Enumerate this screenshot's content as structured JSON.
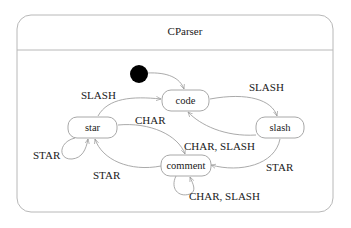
{
  "diagram": {
    "title": "CParser",
    "initial_state": "initial-pseudostate",
    "states": [
      {
        "id": "code",
        "label": "code"
      },
      {
        "id": "star",
        "label": "star"
      },
      {
        "id": "slash",
        "label": "slash"
      },
      {
        "id": "comment",
        "label": "comment"
      }
    ],
    "transitions": [
      {
        "from": "initial",
        "to": "code",
        "label": ""
      },
      {
        "from": "code",
        "to": "slash",
        "label": "SLASH"
      },
      {
        "from": "slash",
        "to": "code",
        "label": "CHAR, SLASH"
      },
      {
        "from": "slash",
        "to": "comment",
        "label": "STAR"
      },
      {
        "from": "comment",
        "to": "comment",
        "label": "CHAR, SLASH"
      },
      {
        "from": "comment",
        "to": "star",
        "label": "STAR"
      },
      {
        "from": "star",
        "to": "star",
        "label": "STAR"
      },
      {
        "from": "star",
        "to": "comment",
        "label": "CHAR"
      },
      {
        "from": "star",
        "to": "code",
        "label": "SLASH"
      }
    ],
    "colors": {
      "frame": "#b8b8b8",
      "state_border": "#a8a8a8",
      "edge": "#a0a0a0",
      "initial_fill": "#000000",
      "text": "#1a1a1a"
    }
  }
}
